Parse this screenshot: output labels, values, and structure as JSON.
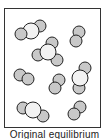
{
  "caption": "Original equilibrium",
  "colors": {
    "atom_gray": "#c8c8c8",
    "atom_white": "#f2f2f2",
    "stroke": "#222222",
    "box": "#333333"
  },
  "molecules": [
    {
      "type": "triatomic-linear",
      "atoms": [
        {
          "x": 40,
          "y": 26,
          "r": 6,
          "c": "gray"
        },
        {
          "x": 31,
          "y": 31,
          "r": 8,
          "c": "white"
        },
        {
          "x": 21,
          "y": 34,
          "r": 6,
          "c": "gray"
        }
      ]
    },
    {
      "type": "tetratomic-trigonal",
      "atoms": [
        {
          "x": 52,
          "y": 43,
          "r": 6,
          "c": "gray"
        },
        {
          "x": 38,
          "y": 55,
          "r": 6,
          "c": "gray"
        },
        {
          "x": 57,
          "y": 60,
          "r": 6,
          "c": "gray"
        },
        {
          "x": 48,
          "y": 52,
          "r": 8,
          "c": "white"
        }
      ]
    },
    {
      "type": "diatomic",
      "atoms": [
        {
          "x": 79,
          "y": 32,
          "r": 6,
          "c": "gray"
        },
        {
          "x": 76,
          "y": 41,
          "r": 6,
          "c": "gray"
        }
      ]
    },
    {
      "type": "diatomic",
      "atoms": [
        {
          "x": 20,
          "y": 75,
          "r": 6,
          "c": "gray"
        },
        {
          "x": 28,
          "y": 79,
          "r": 6,
          "c": "gray"
        }
      ]
    },
    {
      "type": "diatomic",
      "atoms": [
        {
          "x": 59,
          "y": 80,
          "r": 6,
          "c": "gray"
        },
        {
          "x": 55,
          "y": 88,
          "r": 6,
          "c": "gray"
        }
      ]
    },
    {
      "type": "triatomic-linear",
      "atoms": [
        {
          "x": 79,
          "y": 88,
          "r": 6,
          "c": "gray"
        },
        {
          "x": 85,
          "y": 68,
          "r": 6,
          "c": "gray"
        },
        {
          "x": 80,
          "y": 78,
          "r": 8,
          "c": "white"
        }
      ]
    },
    {
      "type": "triatomic-linear",
      "atoms": [
        {
          "x": 23,
          "y": 108,
          "r": 6,
          "c": "gray"
        },
        {
          "x": 43,
          "y": 116,
          "r": 6,
          "c": "gray"
        },
        {
          "x": 33,
          "y": 110,
          "r": 8,
          "c": "white"
        }
      ]
    },
    {
      "type": "diatomic",
      "atoms": [
        {
          "x": 80,
          "y": 107,
          "r": 6,
          "c": "gray"
        },
        {
          "x": 74,
          "y": 114,
          "r": 6,
          "c": "gray"
        }
      ]
    }
  ]
}
